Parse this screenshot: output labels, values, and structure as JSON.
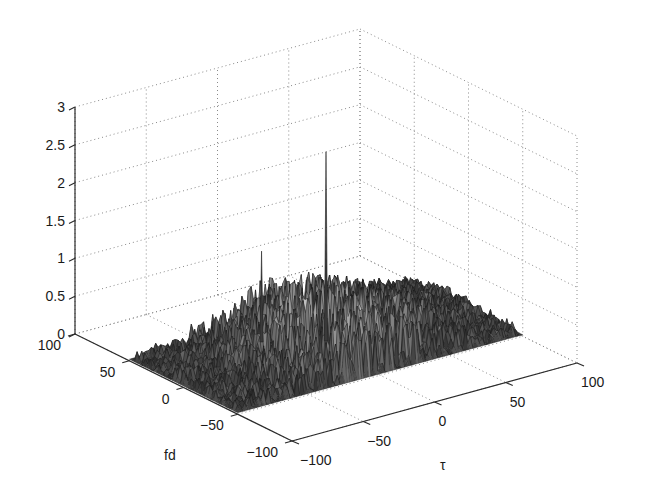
{
  "chart_data": {
    "type": "surface3d",
    "title": "",
    "xlabel": "τ",
    "ylabel": "fd",
    "zlabel": "",
    "xlim": [
      -100,
      100
    ],
    "ylim": [
      -100,
      100
    ],
    "zlim": [
      0,
      3
    ],
    "x_ticks": [
      -100,
      -50,
      0,
      50,
      100
    ],
    "y_ticks": [
      -100,
      -50,
      0,
      50,
      100
    ],
    "z_ticks": [
      0,
      0.5,
      1,
      1.5,
      2,
      2.5,
      3
    ],
    "x_tick_labels": [
      "−100",
      "−50",
      "0",
      "50",
      "100"
    ],
    "y_tick_labels": [
      "−100",
      "−50",
      "0",
      "50",
      "100"
    ],
    "z_tick_labels": [
      "0",
      "0.5",
      "1",
      "1.5",
      "2",
      "2.5",
      "3"
    ],
    "grid": true,
    "surface_extent": {
      "tau": [
        -100,
        100
      ],
      "fd": [
        -50,
        50
      ]
    },
    "surface_description": "Noise-like ambiguity surface, amplitudes mostly 0–0.8, rising toward the center τ≈0",
    "peaks": [
      {
        "tau": 0,
        "fd": 0,
        "z": 2.6,
        "label": "main peak"
      },
      {
        "tau": -30,
        "fd": 20,
        "z": 1.3,
        "label": "secondary peak"
      }
    ],
    "background_level": 0.35,
    "colors": {
      "surface": "#262626",
      "surface_highlight": "#9a9a9a",
      "axis": "#2a2a2a",
      "grid": "#8a8a8a",
      "background": "#ffffff"
    }
  }
}
